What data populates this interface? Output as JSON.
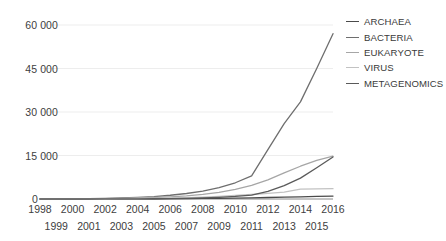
{
  "chart_data": {
    "type": "line",
    "title": "",
    "xlabel": "",
    "ylabel": "",
    "grid": true,
    "legend_position": "right",
    "x": [
      1998,
      1999,
      2000,
      2001,
      2002,
      2003,
      2004,
      2005,
      2006,
      2007,
      2008,
      2009,
      2010,
      2011,
      2012,
      2013,
      2014,
      2015,
      2016
    ],
    "categories": [
      "1998",
      "1999",
      "2000",
      "2001",
      "2002",
      "2003",
      "2004",
      "2005",
      "2006",
      "2007",
      "2008",
      "2009",
      "2010",
      "2011",
      "2012",
      "2013",
      "2014",
      "2015",
      "2016"
    ],
    "xlim": [
      1998,
      2016
    ],
    "ylim": [
      0,
      60000
    ],
    "yticks": [
      0,
      15000,
      30000,
      45000,
      60000
    ],
    "ytick_labels": [
      "0",
      "15 000",
      "30 000",
      "45 000",
      "60 000"
    ],
    "series": [
      {
        "name": "ARCHAEA",
        "color": "#4a4a4a",
        "values": [
          0,
          0,
          0,
          10,
          20,
          30,
          50,
          70,
          100,
          140,
          190,
          250,
          330,
          420,
          520,
          640,
          760,
          880,
          1000
        ]
      },
      {
        "name": "BACTERIA",
        "color": "#6e6e6e",
        "values": [
          0,
          20,
          60,
          130,
          230,
          360,
          560,
          850,
          1300,
          1900,
          2700,
          3900,
          5600,
          8000,
          17000,
          26000,
          33500,
          45000,
          57000
        ]
      },
      {
        "name": "EUKARYOTE",
        "color": "#a6a6a6",
        "values": [
          0,
          10,
          30,
          70,
          130,
          220,
          350,
          520,
          760,
          1100,
          1600,
          2300,
          3300,
          4700,
          6600,
          9000,
          11300,
          13300,
          14800
        ]
      },
      {
        "name": "VIRUS",
        "color": "#c2c2c2",
        "values": [
          0,
          5,
          15,
          35,
          65,
          110,
          170,
          250,
          360,
          500,
          680,
          900,
          1200,
          1550,
          1950,
          2400,
          3400,
          3500,
          3550
        ]
      },
      {
        "name": "METAGENOMICS",
        "color": "#5a5a5a",
        "values": [
          0,
          0,
          0,
          5,
          15,
          30,
          55,
          90,
          150,
          240,
          380,
          580,
          880,
          1350,
          2600,
          4600,
          7200,
          10800,
          14500
        ]
      }
    ]
  },
  "legend": {
    "items": [
      {
        "label": "ARCHAEA",
        "color": "#4a4a4a"
      },
      {
        "label": "BACTERIA",
        "color": "#6e6e6e"
      },
      {
        "label": "EUKARYOTE",
        "color": "#a6a6a6"
      },
      {
        "label": "VIRUS",
        "color": "#c2c2c2"
      },
      {
        "label": "METAGENOMICS",
        "color": "#5a5a5a"
      }
    ]
  },
  "axes": {
    "y_tick_labels": [
      "60 000",
      "45 000",
      "30 000",
      "15 000",
      "0"
    ],
    "x_row_top": [
      "1998",
      "2000",
      "2002",
      "2004",
      "2006",
      "2008",
      "2010",
      "2012",
      "2014",
      "2016"
    ],
    "x_row_bottom": [
      "1999",
      "2001",
      "2003",
      "2005",
      "2007",
      "2009",
      "2011",
      "2013",
      "2015"
    ]
  },
  "colors": {
    "gridline": "#ededed",
    "axis": "#808080",
    "text": "#404040"
  }
}
